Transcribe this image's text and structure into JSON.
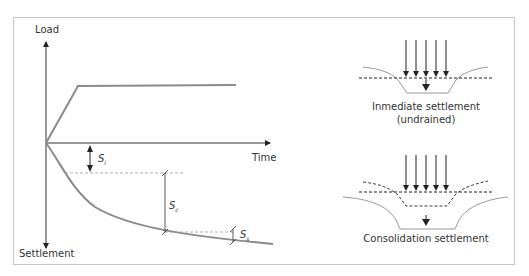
{
  "chart": {
    "y_axis_top_label": "Load",
    "y_axis_bottom_label": "Settlement",
    "x_axis_label": "Time",
    "symbols": {
      "immediate": {
        "base": "S",
        "sub": "i"
      },
      "consolidation": {
        "base": "S",
        "sub": "c"
      },
      "secondary": {
        "base": "S",
        "sub": "s"
      }
    }
  },
  "panels": {
    "immediate": {
      "caption_line1": "Inmediate settlement",
      "caption_line2": "(undrained)"
    },
    "consolidation": {
      "caption": "Consolidation settlement"
    }
  },
  "colors": {
    "curve": "#8a8a8a",
    "axis": "#333333",
    "frame": "#c8c8c8",
    "dashed": "#999999"
  }
}
